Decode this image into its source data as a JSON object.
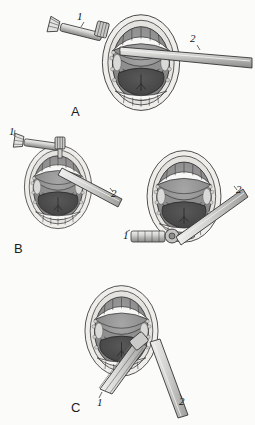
{
  "figure": {
    "background_color": "#fbfbfa",
    "ink_color": "#1c1c1c",
    "style": "grayscale line illustration",
    "palette": {
      "outline": "#2b2b2b",
      "lip_fill": "#f2f1ee",
      "skin_fill": "#e8e7e3",
      "mucosa_light": "#bcbcbc",
      "mucosa_mid": "#9a9a9a",
      "palate_gray": "#8f8f8f",
      "tongue_dark": "#4e4e4e",
      "tongue_darkest": "#3d3d3d",
      "tooth_white": "#f7f7f5",
      "instrument_light": "#d8d8d6",
      "instrument_mid": "#b0b0ae",
      "instrument_dark": "#8a8a88"
    }
  },
  "panels": [
    {
      "id": "A",
      "letter": "A",
      "letter_x": 71,
      "letter_y": 104,
      "description": "Open mouth viewed frontally with instrument 1 angled from upper left and instrument 2 entering horizontally from the right",
      "callouts": [
        {
          "label": "1",
          "x": 77,
          "y": 10,
          "instrument": "bristled-probe",
          "approach": "upper-left"
        },
        {
          "label": "2",
          "x": 190,
          "y": 32,
          "instrument": "straight-shaft-retractor",
          "approach": "right-horizontal"
        }
      ]
    },
    {
      "id": "B",
      "letter": "B",
      "letter_x": 14,
      "letter_y": 241,
      "description": "Open mouth with instrument 1 held vertically above the upper lip and instrument 2 angled down from the right",
      "callouts": [
        {
          "label": "1",
          "x": 9,
          "y": 125,
          "instrument": "bristled-probe",
          "approach": "top-left-vertical"
        },
        {
          "label": "2",
          "x": 111,
          "y": 187,
          "instrument": "straight-shaft-retractor",
          "approach": "right-descending"
        }
      ]
    },
    {
      "id": "D",
      "letter": "",
      "letter_x": 0,
      "letter_y": 0,
      "description": "Open mouth with instrument 1 entering horizontally from the lower left and instrument 2 angled down from the upper right",
      "callouts": [
        {
          "label": "1",
          "x": 123,
          "y": 229,
          "instrument": "bristled-probe",
          "approach": "lower-left-horizontal"
        },
        {
          "label": "2",
          "x": 236,
          "y": 183,
          "instrument": "straight-shaft-retractor",
          "approach": "upper-right-descending"
        }
      ]
    },
    {
      "id": "C",
      "letter": "C",
      "letter_x": 71,
      "letter_y": 400,
      "description": "Open mouth with both instruments approaching from below, instrument 1 from lower left and instrument 2 from lower right",
      "callouts": [
        {
          "label": "1",
          "x": 97,
          "y": 396,
          "instrument": "bristled-probe",
          "approach": "bottom-left"
        },
        {
          "label": "2",
          "x": 179,
          "y": 395,
          "instrument": "straight-shaft-retractor",
          "approach": "bottom-right"
        }
      ]
    }
  ],
  "anatomy_labels": {
    "upper_teeth": "upper dental arch",
    "lower_teeth": "lower dental arch",
    "tongue": "tongue",
    "palate": "soft palate",
    "lips": "lips"
  }
}
